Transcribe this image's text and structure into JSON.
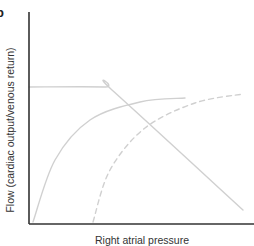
{
  "panel_marker": "b",
  "chart_data": {
    "type": "line",
    "title": "",
    "xlabel": "Right atrial pressure",
    "ylabel": "Flow (cardiac output/venous return)",
    "grid": false,
    "legend": null,
    "ticks": {
      "x": [],
      "y": []
    },
    "series": [
      {
        "name": "Venous return curve",
        "style": "solid",
        "color": "#d0d0d0",
        "shape": "plateau then linear decline",
        "points_px": [
          [
            29,
            87
          ],
          [
            105,
            87
          ],
          [
            112,
            90
          ],
          [
            243,
            210
          ]
        ]
      },
      {
        "name": "Cardiac output curve (normal)",
        "style": "solid",
        "color": "#d0d0d0",
        "shape": "steep rise then plateau",
        "points_px": [
          [
            33,
            222
          ],
          [
            55,
            160
          ],
          [
            90,
            120
          ],
          [
            140,
            102
          ],
          [
            185,
            98
          ]
        ]
      },
      {
        "name": "Cardiac output curve (shifted right)",
        "style": "dashed",
        "color": "#d0d0d0",
        "shape": "steep rise then plateau",
        "points_px": [
          [
            93,
            222
          ],
          [
            110,
            170
          ],
          [
            145,
            128
          ],
          [
            195,
            103
          ],
          [
            243,
            94
          ]
        ]
      }
    ],
    "axes_px": {
      "origin": [
        29,
        224
      ],
      "y_top": 12,
      "x_right": 254
    },
    "axis_color": "#333333"
  }
}
